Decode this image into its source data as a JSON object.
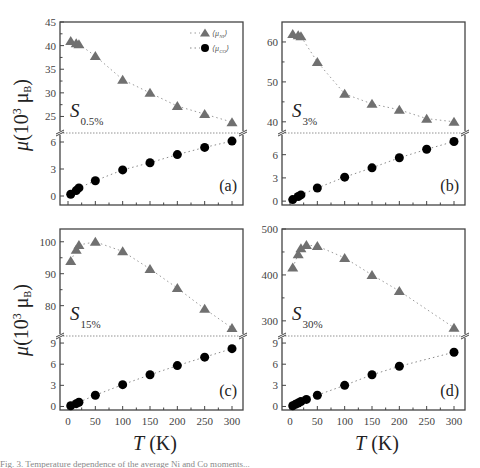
{
  "figure": {
    "y_axis_title": "μ (10³ μB)",
    "y_axis_title_parts": {
      "mu": "μ",
      "open": "(10",
      "exp": "3",
      "unit": " μ",
      "unit_sub": "B",
      "close": ")"
    },
    "x_axis_title_parts": {
      "var": "T",
      "unit": " (K)"
    },
    "legend": [
      {
        "label_main": "⟨μ",
        "label_sub": "NI",
        "label_close": "⟩",
        "marker": "triangle",
        "color": "#707070"
      },
      {
        "label_main": "⟨μ",
        "label_sub": "CO",
        "label_close": "⟩",
        "marker": "circle",
        "color": "#000000"
      }
    ]
  },
  "chart_data": [
    {
      "type": "scatter",
      "panel": "(a)",
      "sample_label": "S",
      "sample_sub": "0.5%",
      "xlabel": "T (K)",
      "ylabel": "μ (10³ μB)",
      "xlim": [
        0,
        300
      ],
      "x_ticks": [
        0,
        50,
        100,
        150,
        200,
        250,
        300
      ],
      "upper": {
        "ylim": [
          21.5,
          45
        ],
        "y_ticks": [
          25,
          30,
          35,
          40,
          45
        ]
      },
      "lower": {
        "ylim": [
          -1,
          7
        ],
        "y_ticks": [
          0,
          3,
          6
        ]
      },
      "series": [
        {
          "name": "⟨μ_NI⟩",
          "x": [
            5,
            15,
            20,
            50,
            100,
            150,
            200,
            250,
            300
          ],
          "values": [
            41.0,
            40.5,
            40.3,
            37.8,
            32.8,
            30.0,
            27.2,
            25.5,
            23.8
          ]
        },
        {
          "name": "⟨μ_CO⟩",
          "x": [
            5,
            15,
            20,
            50,
            100,
            150,
            200,
            250,
            300
          ],
          "values": [
            0.2,
            0.6,
            0.9,
            1.7,
            2.9,
            3.7,
            4.6,
            5.4,
            6.1
          ]
        }
      ],
      "legend_position": "upper right"
    },
    {
      "type": "scatter",
      "panel": "(b)",
      "sample_label": "S",
      "sample_sub": "3%",
      "xlabel": "T (K)",
      "ylabel": "μ (10³ μB)",
      "xlim": [
        0,
        300
      ],
      "x_ticks": [
        0,
        50,
        100,
        150,
        200,
        250,
        300
      ],
      "upper": {
        "ylim": [
          37.2,
          65
        ],
        "y_ticks": [
          40,
          50,
          60
        ]
      },
      "lower": {
        "ylim": [
          -0.5,
          8.8
        ],
        "y_ticks": [
          0,
          3,
          6
        ]
      },
      "series": [
        {
          "name": "⟨μ_NI⟩",
          "x": [
            5,
            15,
            20,
            50,
            100,
            150,
            200,
            250,
            300
          ],
          "values": [
            62.0,
            61.7,
            61.4,
            55.0,
            47.0,
            44.5,
            43.0,
            40.8,
            40.0
          ]
        },
        {
          "name": "⟨μ_CO⟩",
          "x": [
            5,
            15,
            20,
            50,
            100,
            150,
            200,
            250,
            300
          ],
          "values": [
            0.2,
            0.6,
            0.8,
            1.7,
            3.1,
            4.3,
            5.6,
            6.7,
            7.7
          ]
        }
      ]
    },
    {
      "type": "scatter",
      "panel": "(c)",
      "sample_label": "S",
      "sample_sub": "15%",
      "xlabel": "T (K)",
      "ylabel": "μ (10³ μB)",
      "xlim": [
        0,
        300
      ],
      "x_ticks": [
        0,
        50,
        100,
        150,
        200,
        250,
        300
      ],
      "x_tick_labels": [
        "0",
        "50",
        "100",
        "150",
        "200",
        "250",
        "300"
      ],
      "upper": {
        "ylim": [
          70.5,
          104
        ],
        "y_ticks": [
          80,
          90,
          100
        ]
      },
      "lower": {
        "ylim": [
          -0.5,
          10
        ],
        "y_ticks": [
          0,
          3,
          6,
          9
        ]
      },
      "series": [
        {
          "name": "⟨μ_NI⟩",
          "x": [
            5,
            15,
            20,
            50,
            100,
            150,
            200,
            250,
            300
          ],
          "values": [
            94.0,
            97.5,
            99.0,
            100.0,
            97.0,
            91.5,
            85.5,
            79.0,
            73.0
          ]
        },
        {
          "name": "⟨μ_CO⟩",
          "x": [
            5,
            15,
            20,
            50,
            100,
            150,
            200,
            250,
            300
          ],
          "values": [
            0.1,
            0.4,
            0.6,
            1.6,
            3.1,
            4.5,
            5.8,
            7.0,
            8.2
          ]
        }
      ]
    },
    {
      "type": "scatter",
      "panel": "(d)",
      "sample_label": "S",
      "sample_sub": "30%",
      "xlabel": "T (K)",
      "ylabel": "μ (10³ μB)",
      "xlim": [
        0,
        300
      ],
      "x_ticks": [
        0,
        50,
        100,
        150,
        200,
        250,
        300
      ],
      "x_tick_labels": [
        "0",
        "50",
        "100",
        "150",
        "200",
        "250",
        "300"
      ],
      "upper": {
        "ylim": [
          267,
          500
        ],
        "y_ticks": [
          300,
          400,
          500
        ]
      },
      "lower": {
        "ylim": [
          -0.5,
          10
        ],
        "y_ticks": [
          0,
          3,
          6,
          9
        ]
      },
      "series": [
        {
          "name": "⟨μ_NI⟩",
          "x": [
            5,
            15,
            20,
            30,
            50,
            100,
            150,
            200,
            300
          ],
          "values": [
            416,
            445,
            458,
            465,
            463,
            437,
            400,
            365,
            285
          ]
        },
        {
          "name": "⟨μ_CO⟩",
          "x": [
            5,
            10,
            15,
            20,
            30,
            50,
            100,
            150,
            200,
            300
          ],
          "values": [
            0.1,
            0.3,
            0.5,
            0.7,
            1.0,
            1.6,
            3.0,
            4.5,
            5.7,
            7.7
          ]
        }
      ]
    }
  ],
  "colors": {
    "triangle": "#707070",
    "circle": "#000000",
    "frame": "#444444",
    "triangle_fit": "#9a9a9a",
    "circle_fit": "#8a8a8a"
  },
  "caption": "Fig. 3. Temperature dependence of the average Ni and Co moments..."
}
